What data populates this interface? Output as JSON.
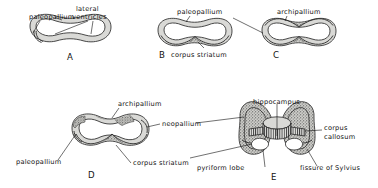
{
  "figure": {
    "background_color": "#ffffff",
    "ink_color": "#111111",
    "mantle_color": "#d9d9d6",
    "stipple_color": "#555555"
  },
  "panels": [
    {
      "id": "A",
      "letter": "A",
      "labels": [
        {
          "key": "paleopallium",
          "text": "paleopallium"
        },
        {
          "key": "lateral_ventricles_line1",
          "text": "lateral"
        },
        {
          "key": "lateral_ventricles_line2",
          "text": "ventricles"
        }
      ]
    },
    {
      "id": "B",
      "letter": "B",
      "labels": [
        {
          "key": "paleopallium",
          "text": "paleopallium"
        },
        {
          "key": "corpus_striatum",
          "text": "corpus striatum"
        }
      ]
    },
    {
      "id": "C",
      "letter": "C",
      "labels": [
        {
          "key": "archipallium",
          "text": "archipallium"
        }
      ]
    },
    {
      "id": "D",
      "letter": "D",
      "labels": [
        {
          "key": "archipallium",
          "text": "archipallium"
        },
        {
          "key": "neopallium",
          "text": "neopallium"
        },
        {
          "key": "paleopallium",
          "text": "paleopallium"
        },
        {
          "key": "corpus_striatum",
          "text": "corpus striatum"
        }
      ]
    },
    {
      "id": "E",
      "letter": "E",
      "labels": [
        {
          "key": "hippocampus",
          "text": "hippocampus"
        },
        {
          "key": "corpus_callosum_line1",
          "text": "corpus"
        },
        {
          "key": "corpus_callosum_line2",
          "text": "callosum"
        },
        {
          "key": "pyriform_lobe",
          "text": "pyriform lobe"
        },
        {
          "key": "fissure_of_sylvius",
          "text": "fissure of Sylvius"
        }
      ]
    }
  ]
}
